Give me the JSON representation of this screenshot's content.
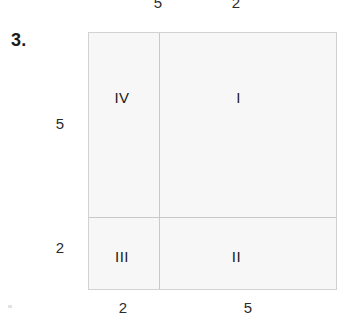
{
  "problem": {
    "number": "3."
  },
  "figure": {
    "type": "area-model-grid",
    "quadrants": [
      {
        "id": "IV",
        "label": "IV",
        "position": "top-left"
      },
      {
        "id": "I",
        "label": "I",
        "position": "top-right"
      },
      {
        "id": "III",
        "label": "III",
        "position": "bottom-left"
      },
      {
        "id": "II",
        "label": "II",
        "position": "bottom-right"
      }
    ],
    "dimensions": {
      "top": [
        {
          "label": "5",
          "spans": "left-column"
        },
        {
          "label": "2",
          "spans": "right-column"
        }
      ],
      "left": [
        {
          "label": "5",
          "spans": "upper-row"
        },
        {
          "label": "2",
          "spans": "lower-row"
        }
      ],
      "bottom": [
        {
          "label": "2",
          "spans": "left-column"
        },
        {
          "label": "5",
          "spans": "right-column"
        }
      ]
    },
    "colors": {
      "cell_fill": "#f7f7f7",
      "outer_border": "#d2d2d2",
      "divider": "#c9c9c9",
      "text": "#1a1a1a",
      "page_background": "#ffffff"
    }
  }
}
